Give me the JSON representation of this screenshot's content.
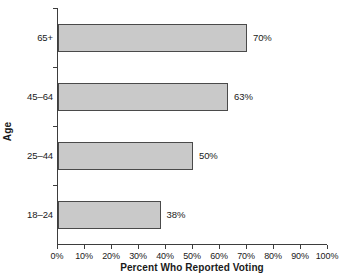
{
  "chart_data": {
    "type": "bar",
    "orientation": "horizontal",
    "title": "",
    "xlabel": "Percent Who Reported Voting",
    "ylabel": "Age",
    "categories": [
      "18–24",
      "25–44",
      "45–64",
      "65+"
    ],
    "values": [
      38,
      50,
      63,
      70
    ],
    "data_labels": [
      "38%",
      "50%",
      "63%",
      "70%"
    ],
    "xlim": [
      0,
      100
    ],
    "xticks": [
      0,
      10,
      20,
      30,
      40,
      50,
      60,
      70,
      80,
      90,
      100
    ],
    "xtick_labels": [
      "0%",
      "10%",
      "20%",
      "30%",
      "40%",
      "50%",
      "60%",
      "70%",
      "80%",
      "90%",
      "100%"
    ],
    "grid": false,
    "legend": null,
    "bar_fill_color": "#c9c9c9",
    "bar_edge_color": "#4a4a4a",
    "axis_color": "#3d3d3d",
    "text_color": "#1a1a1a",
    "background_color": "#ffffff"
  }
}
